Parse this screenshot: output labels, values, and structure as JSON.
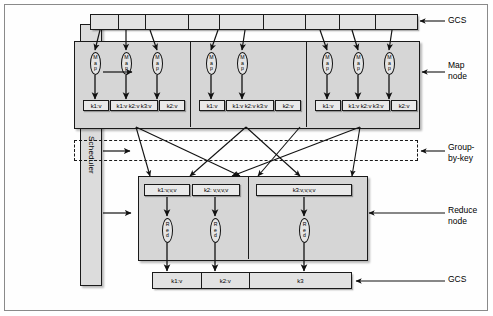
{
  "scheduler": {
    "label": "Scheduler"
  },
  "gcs_top": {
    "label": "GCS",
    "segments": [
      "",
      "",
      "",
      "",
      "",
      "",
      "",
      "",
      ""
    ]
  },
  "gcs_bottom": {
    "label": "GCS",
    "segments": [
      "k1:v",
      "k2:v",
      "k3"
    ]
  },
  "map_section": {
    "label": "Map\nnode",
    "oval_label": "Map",
    "oval_letters": [
      "M",
      "a",
      "p"
    ],
    "groups": [
      {
        "maps": 3,
        "outputs": [
          "k1:v",
          "k1:v k2:v k3:v",
          "k2:v"
        ]
      },
      {
        "maps": 2,
        "outputs": [
          "k1:v",
          "k1:v k2:v k3:v",
          "k2:v"
        ]
      },
      {
        "maps": 3,
        "outputs": [
          "k1:v",
          "k1:v k2:v k3:v",
          "k2:v"
        ]
      }
    ]
  },
  "group_by_key": {
    "label": "Group-\nby-key"
  },
  "reduce_section": {
    "label": "Reduce\nnode",
    "oval_label": "Red",
    "oval_letters": [
      "R",
      "e",
      "d"
    ],
    "groups": [
      {
        "inputs": [
          "k1:v,v,v",
          "k2: v,v,v,v"
        ],
        "reducers": 2
      },
      {
        "inputs": [
          "k3:v,v,v,v"
        ],
        "reducers": 1
      }
    ]
  },
  "colors": {
    "node_fill": "#d6d6d6",
    "box_fill": "#e9e9e9",
    "bar_fill": "#e2e2e2",
    "stroke": "#1a1a1a",
    "page": "#ffffff"
  }
}
